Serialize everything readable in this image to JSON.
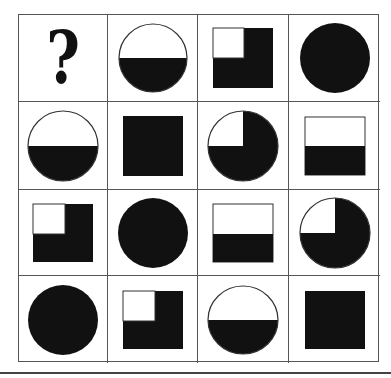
{
  "puzzle": {
    "missing_symbol": "?",
    "colors": {
      "fill": "#111111",
      "outline": "#333333",
      "background": "#ffffff",
      "grid_line": "#555555"
    },
    "grid": [
      [
        "question-mark",
        "circle-bottom-half-filled",
        "square-three-quarter-filled",
        "circle-filled"
      ],
      [
        "circle-bottom-half-filled",
        "square-filled",
        "circle-three-quarter-filled",
        "square-bottom-half-filled"
      ],
      [
        "square-three-quarter-filled",
        "circle-filled",
        "square-bottom-half-filled",
        "circle-three-quarter-filled"
      ],
      [
        "circle-filled",
        "square-three-quarter-filled",
        "circle-bottom-half-filled",
        "square-filled"
      ]
    ]
  }
}
